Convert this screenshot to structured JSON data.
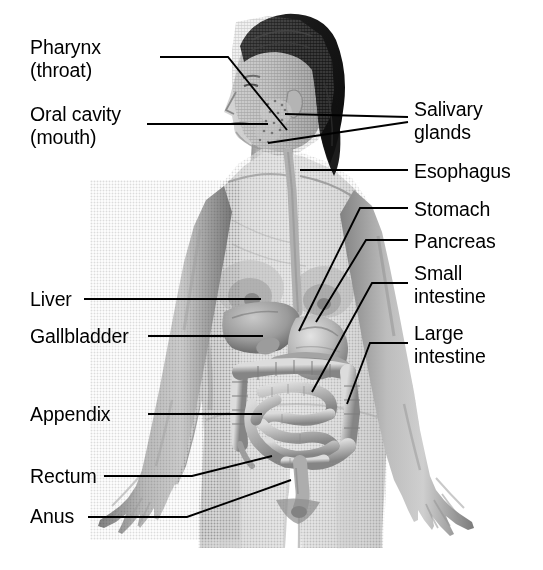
{
  "figure": {
    "background_color": "#ffffff",
    "line_color": "#000000",
    "text_color": "#000000",
    "style": "grayscale halftone medical illustration"
  },
  "labels": [
    {
      "id": "pharynx",
      "text": "Pharynx\n(throat)",
      "side": "left",
      "x": 30,
      "y": 36
    },
    {
      "id": "oral-cavity",
      "text": "Oral cavity\n(mouth)",
      "side": "left",
      "x": 30,
      "y": 103
    },
    {
      "id": "liver",
      "text": "Liver",
      "side": "left",
      "x": 30,
      "y": 288
    },
    {
      "id": "gallbladder",
      "text": "Gallbladder",
      "side": "left",
      "x": 30,
      "y": 325
    },
    {
      "id": "appendix",
      "text": "Appendix",
      "side": "left",
      "x": 30,
      "y": 403
    },
    {
      "id": "rectum",
      "text": "Rectum",
      "side": "left",
      "x": 30,
      "y": 465
    },
    {
      "id": "anus",
      "text": "Anus",
      "side": "left",
      "x": 30,
      "y": 505
    },
    {
      "id": "salivary-glands",
      "text": "Salivary\nglands",
      "side": "right",
      "x": 414,
      "y": 98
    },
    {
      "id": "esophagus",
      "text": "Esophagus",
      "side": "right",
      "x": 414,
      "y": 160
    },
    {
      "id": "stomach",
      "text": "Stomach",
      "side": "right",
      "x": 414,
      "y": 198
    },
    {
      "id": "pancreas",
      "text": "Pancreas",
      "side": "right",
      "x": 414,
      "y": 230
    },
    {
      "id": "small-intestine",
      "text": "Small\nintestine",
      "side": "right",
      "x": 414,
      "y": 262
    },
    {
      "id": "large-intestine",
      "text": "Large\nintestine",
      "side": "right",
      "x": 414,
      "y": 322
    }
  ],
  "leader_lines": [
    {
      "id": "pharynx-leader",
      "points": "160,57 228,57 287,130"
    },
    {
      "id": "oral-cavity-leader",
      "points": "147,124 268,124"
    },
    {
      "id": "salivary-glands-leader",
      "points": "408,117 285,114"
    },
    {
      "id": "salivary-glands-leader2",
      "points": "408,122 268,143"
    },
    {
      "id": "esophagus-leader",
      "points": "408,170 300,170"
    },
    {
      "id": "stomach-leader",
      "points": "408,208 360,208 299,331"
    },
    {
      "id": "pancreas-leader",
      "points": "408,240 366,240 316,322"
    },
    {
      "id": "small-intestine-leader",
      "points": "408,283 372,283 312,392"
    },
    {
      "id": "large-intestine-leader",
      "points": "408,343 370,343 347,404"
    },
    {
      "id": "liver-leader",
      "points": "84,299 261,299"
    },
    {
      "id": "gallbladder-leader",
      "points": "148,336 263,336"
    },
    {
      "id": "appendix-leader",
      "points": "148,414 262,414"
    },
    {
      "id": "rectum-leader",
      "points": "104,476 192,476 272,456"
    },
    {
      "id": "anus-leader",
      "points": "88,517 187,517 291,480"
    }
  ]
}
